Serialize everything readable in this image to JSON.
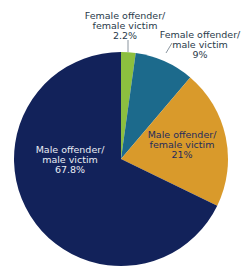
{
  "chart_data": {
    "type": "pie",
    "title": "",
    "start_angle_deg": 0,
    "direction": "clockwise",
    "slices": [
      {
        "label": "Female offender/ female victim",
        "line1": "Female offender/",
        "line2": "female victim",
        "value": 2.2,
        "value_label": "2.2%",
        "color": "#8cbf3f"
      },
      {
        "label": "Female offender/ male victim",
        "line1": "Female offender/",
        "line2": "male victim",
        "value": 9,
        "value_label": "9%",
        "color": "#1c6a8c"
      },
      {
        "label": "Male offender/ female victim",
        "line1": "Male offender/",
        "line2": "female victim",
        "value": 21,
        "value_label": "21%",
        "color": "#d99a2b"
      },
      {
        "label": "Male offender/ male victim",
        "line1": "Male offender/",
        "line2": "male victim",
        "value": 67.8,
        "value_label": "67.8%",
        "color": "#12225a"
      }
    ]
  }
}
